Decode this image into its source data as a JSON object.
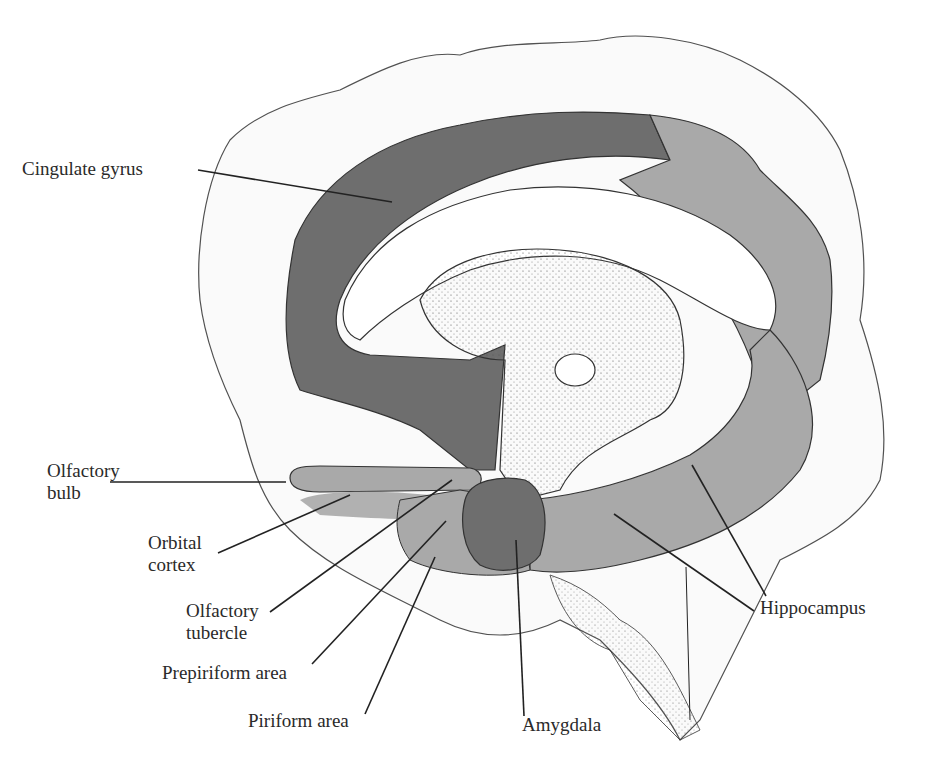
{
  "figure": {
    "colors": {
      "dark_region": "#6e6e6e",
      "light_region": "#a9a9a9",
      "outline": "#333333",
      "background": "#ffffff"
    },
    "labels": {
      "cingulate_gyrus": "Cingulate gyrus",
      "olfactory_bulb_1": "Olfactory",
      "olfactory_bulb_2": "bulb",
      "orbital_cortex_1": "Orbital",
      "orbital_cortex_2": "cortex",
      "olfactory_tubercle_1": "Olfactory",
      "olfactory_tubercle_2": "tubercle",
      "prepiriform_area": "Prepiriform area",
      "piriform_area": "Piriform area",
      "amygdala": "Amygdala",
      "hippocampus": "Hippocampus"
    }
  }
}
